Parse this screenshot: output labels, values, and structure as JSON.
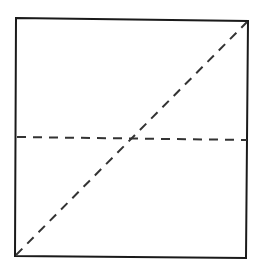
{
  "diagram": {
    "background": "#ffffff",
    "stroke_color": "#1a1a1a",
    "dash_color": "#333333",
    "square": {
      "corners": {
        "top_left": [
          16,
          18
        ],
        "top_right": [
          248,
          21
        ],
        "bottom_right": [
          246,
          258
        ],
        "bottom_left": [
          15,
          256
        ]
      },
      "stroke_width": 2
    },
    "diagonal": {
      "from": [
        16,
        255
      ],
      "to": [
        247,
        22
      ],
      "style": "dashed",
      "dash": "9 7",
      "stroke_width": 2
    },
    "midline": {
      "from": [
        17,
        137
      ],
      "to": [
        247,
        140
      ],
      "style": "dashed",
      "dash": "9 7",
      "stroke_width": 2
    },
    "intersection": [
      132,
      138
    ]
  }
}
